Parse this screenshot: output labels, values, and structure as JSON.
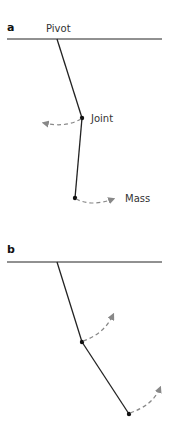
{
  "panels": [
    {
      "label": "a",
      "pivot_label": "Pivot",
      "joint_label": "Joint",
      "mass_label": "Mass",
      "description": "Double pendulum: lower arm swinging; joint motion leftward, mass motion rightward"
    },
    {
      "label": "b",
      "description": "Double pendulum bent configuration; joint and mass both moving up-right"
    }
  ],
  "colors": {
    "line": "#222222",
    "arrow": "#888888",
    "text": "#333333"
  }
}
